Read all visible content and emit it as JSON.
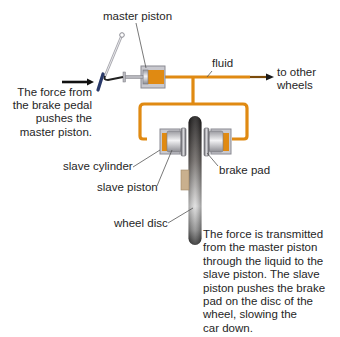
{
  "diagram": {
    "labels": {
      "master_piston": "master piston",
      "fluid": "fluid",
      "to_other_wheels": "to other\nwheels",
      "pedal_force": "The force from\nthe brake pedal\npushes the\nmaster piston.",
      "slave_cylinder": "slave cylinder",
      "slave_piston": "slave piston",
      "brake_pad": "brake pad",
      "wheel_disc": "wheel disc",
      "explanation": "The force is transmitted\nfrom the master piston\nthrough the liquid to the\nslave piston. The slave\npiston pushes the brake\npad on the disc of the\nwheel, slowing the\ncar down."
    },
    "colors": {
      "fluid": "#e08a12",
      "fluid_edge": "#b86d08",
      "cylinder": "#c9c9cf",
      "cylinder_edge": "#8a8a92",
      "pedal": "#2a3a6a",
      "disc_dark": "#1c1a1a",
      "disc_light": "#d8d8d8",
      "pad": "#c9b08e",
      "text": "#262626"
    }
  }
}
